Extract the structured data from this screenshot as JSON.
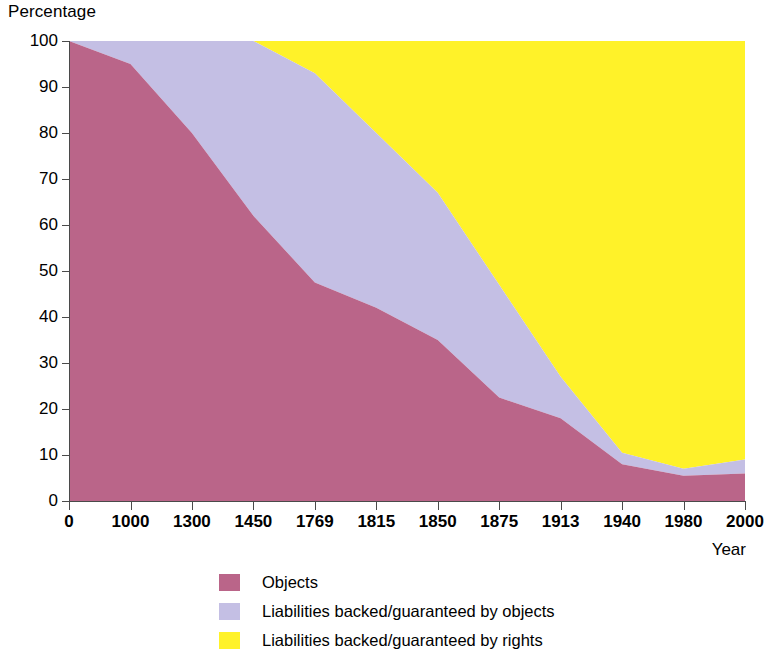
{
  "chart_data": {
    "type": "area",
    "title": "",
    "subtitle": "",
    "xlabel": "Year",
    "ylabel": "Percentage",
    "stacked": true,
    "stack_total": 100,
    "grid": false,
    "legend_position": "bottom",
    "ylim": [
      0,
      100
    ],
    "ytick_labels": [
      "100",
      "90",
      "80",
      "70",
      "60",
      "50",
      "40",
      "30",
      "20",
      "10",
      "0"
    ],
    "ytick_values": [
      100,
      90,
      80,
      70,
      60,
      50,
      40,
      30,
      20,
      10,
      0
    ],
    "categories": [
      "0",
      "1000",
      "1300",
      "1450",
      "1769",
      "1815",
      "1850",
      "1875",
      "1913",
      "1940",
      "1980",
      "2000"
    ],
    "series": [
      {
        "name": "Objects",
        "color": "#ba6589",
        "values": [
          100,
          95,
          80,
          62,
          47.5,
          42,
          35,
          22.5,
          18,
          8,
          5.5,
          6
        ]
      },
      {
        "name": "Liabilities backed/guaranteed by objects",
        "color": "#c4bfe4",
        "values": [
          0,
          5,
          20,
          38,
          45.5,
          38,
          32,
          24.5,
          9,
          2.5,
          1.5,
          3
        ]
      },
      {
        "name": "Liabilities backed/guaranteed by rights",
        "color": "#fff229",
        "values": [
          0,
          0,
          0,
          0,
          7,
          20,
          33,
          53,
          73,
          89.5,
          93,
          91
        ]
      }
    ],
    "cumulative_lower_boundary": [
      100,
      95,
      80,
      62,
      47.5,
      42,
      35,
      22.5,
      18,
      8,
      5.5,
      6
    ],
    "cumulative_upper_boundary": [
      100,
      100,
      100,
      100,
      93,
      80,
      67,
      47,
      27,
      10.5,
      7,
      9
    ]
  },
  "axes": {
    "y_title": "Percentage",
    "x_title": "Year"
  },
  "legend": {
    "items": [
      {
        "label": "Objects",
        "color": "#ba6589"
      },
      {
        "label": "Liabilities backed/guaranteed by objects",
        "color": "#c4bfe4"
      },
      {
        "label": "Liabilities backed/guaranteed by rights",
        "color": "#fff229"
      }
    ]
  }
}
